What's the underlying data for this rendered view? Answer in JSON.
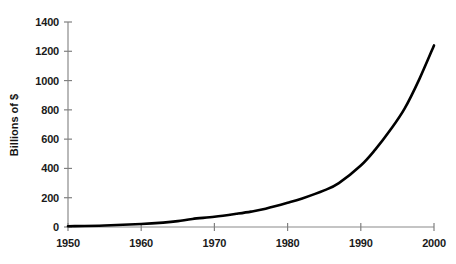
{
  "chart_data": {
    "type": "line",
    "title": "",
    "xlabel": "",
    "ylabel": "Billions of $",
    "xlim": [
      1950,
      2000
    ],
    "ylim": [
      0,
      1400
    ],
    "grid": false,
    "legend": null,
    "legend_position": "none",
    "x_ticks": [
      1950,
      1960,
      1970,
      1980,
      1990,
      2000
    ],
    "x_tick_labels": [
      "1950",
      "1960",
      "1970",
      "1980",
      "1990",
      "2000"
    ],
    "y_ticks": [
      0,
      200,
      400,
      600,
      800,
      1000,
      1200,
      1400
    ],
    "y_tick_labels": [
      "0",
      "200",
      "400",
      "600",
      "800",
      "1000",
      "1200",
      "1400"
    ],
    "series": [
      {
        "name": "Billions of $",
        "color": "#000000",
        "line_width": 2.6,
        "x": [
          1950,
          1955,
          1960,
          1963,
          1965,
          1967,
          1970,
          1973,
          1975,
          1977,
          1980,
          1982,
          1985,
          1987,
          1990,
          1992,
          1994,
          1996,
          1998,
          2000
        ],
        "values": [
          5,
          10,
          20,
          30,
          40,
          55,
          70,
          90,
          105,
          125,
          165,
          195,
          250,
          300,
          420,
          530,
          660,
          810,
          1010,
          1240
        ]
      }
    ],
    "annotations": []
  },
  "axes": {
    "axis_color": "#808080",
    "text_color": "#1a1a1a",
    "background": "#ffffff"
  }
}
